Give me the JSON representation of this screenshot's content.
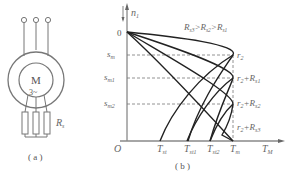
{
  "figure_a": {
    "motor_label": "M",
    "motor_sub": "3~",
    "resistor_label": "R",
    "resistor_sub": "s",
    "caption": "( a )"
  },
  "figure_b": {
    "y_axis_top": "n",
    "y_axis_top_sub": "1",
    "origin_zero": "0",
    "origin": "O",
    "y_ticks": [
      {
        "label": "s",
        "sub": "m"
      },
      {
        "label": "s",
        "sub": "m1"
      },
      {
        "label": "s",
        "sub": "m2"
      }
    ],
    "x_ticks": [
      {
        "label": "T",
        "sub": "st"
      },
      {
        "label": "T",
        "sub": "st1"
      },
      {
        "label": "T",
        "sub": "st2"
      },
      {
        "label": "T",
        "sub": "m"
      }
    ],
    "x_axis_label": "T",
    "x_axis_sub": "M",
    "relation": "R_s3>R_s2>R_s1",
    "relation_parts": [
      "R",
      "s3",
      ">R",
      "s2",
      ">R",
      "s1"
    ],
    "curve_labels": [
      {
        "label": "r",
        "sub": "2",
        "extra": ""
      },
      {
        "label": "r",
        "sub": "2",
        "extra": "+R",
        "extra_sub": "s1"
      },
      {
        "label": "r",
        "sub": "2",
        "extra": "+R",
        "extra_sub": "s2"
      },
      {
        "label": "r",
        "sub": "2",
        "extra": "+R",
        "extra_sub": "s3"
      }
    ],
    "caption": "( b )"
  }
}
